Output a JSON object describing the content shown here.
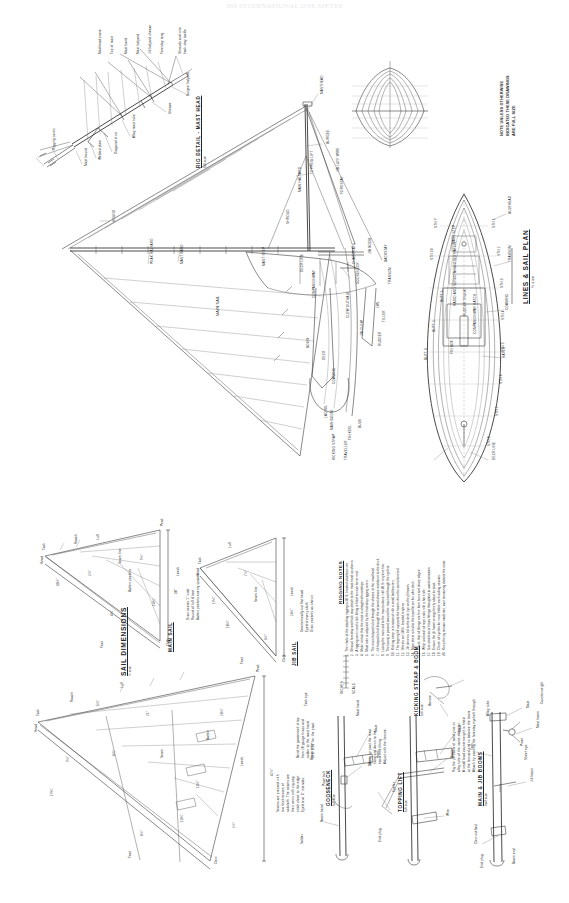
{
  "page": {
    "header": "369   INTERNATIONAL ONE METRE",
    "sheet_background": "#ffffff",
    "ink_color": "#262626"
  },
  "titles": {
    "lines_sail_plan": "LINES & SAIL PLAN",
    "lines_sail_plan_scale": "½ size",
    "sail_dimensions": "SAIL DIMENSIONS",
    "sail_dimensions_scale": "½ size",
    "rig_detail_head": "RIG DETAIL - MAST HEAD",
    "rig_detail_head_scale": "full size",
    "rigging_notes": "RIGGING NOTES",
    "gooseneck": "GOOSENECK",
    "gooseneck_scale": "full size",
    "kicking_strap": "KICKING STRAP & BOOM",
    "kicking_strap_scale": "full size",
    "topping_lift": "TOPPING LIFT",
    "topping_lift_scale": "full size",
    "main_boom": "MAIN & JIB BOOMS",
    "main_boom_scale": "half size",
    "sail_dims_main": "MAIN SAIL",
    "sail_dims_jib": "JIB SAIL"
  },
  "general_note": {
    "line1": "NOTE  UNLESS OTHERWISE",
    "line2": "INDICATED THESE DRAWINGS",
    "line3": "ARE FULL SIZE"
  },
  "masthead_detail": {
    "labels": [
      "Shrouds and wire",
      "back stay tackle",
      "Forestay tang",
      "Jib halyard sheave",
      "Main halyard",
      "Mast band",
      "Top of mast",
      "Masthead crane",
      "Burgee halyard",
      "Sheave",
      "Alloy mast tube",
      "Diagonal strut",
      "Welded plate",
      "Mast hound",
      "Rigging screw"
    ]
  },
  "sail_plan": {
    "labels": [
      "MASTHEAD",
      "BURGEE",
      "TOPPING LIFT",
      "MAIN HALYARD",
      "MAST BAND",
      "PEAK HALYARD",
      "HOUND",
      "BACKSTAY",
      "JIB LUFF WIRE",
      "JIB BOOM",
      "JIB CLEW",
      "MAIN SAIL",
      "LACING",
      "MAIN BOOM",
      "BOOM",
      "KICKING STRAP",
      "CLEW OUTHAUL",
      "TRAVELLER",
      "GOOSENECK",
      "COMPANIONWAY",
      "DECK",
      "COAMING",
      "TRANSOM",
      "FIN KEEL",
      "BULB",
      "LWL",
      "RUDDER",
      "TILLER",
      "MAST STEP",
      "FORESTAY",
      "SHROUD",
      "DECK LINE",
      "CHAINPLATE"
    ]
  },
  "hull_plan": {
    "labels": [
      "BULKHEAD",
      "TRANSOM",
      "COAMING",
      "HATCH",
      "COMPANIONWAY HATCH",
      "RUDDER TRUNK",
      "RADIO AND SERVO MOUNTING HATCH",
      "DECK LINE",
      "MAST STEP",
      "FIN BOX",
      "BUTT 1",
      "BUTT 2",
      "BUTT 3",
      "STN 1",
      "STN 2",
      "STN 3",
      "STN 4",
      "STN 5",
      "STN 6",
      "STN 7",
      "STN 8",
      "STN 9",
      "STN 10"
    ]
  },
  "sail_dimensions": {
    "main": {
      "title": "MAIN SAIL",
      "labels": [
        "Head",
        "Luff",
        "Leech",
        "Foot",
        "Tack",
        "Clew",
        "Batten pockets",
        "Peak",
        "Roach",
        "Seam line"
      ],
      "notes": [
        "Draw seams 1\" wide",
        "Round of luff & foot",
        "Batten pockets evenly spaced"
      ],
      "measurements": [
        "30\"",
        "38½\"",
        "9½\"",
        "4¾\"",
        "2¼\"",
        "14¾\""
      ]
    },
    "jib": {
      "title": "JIB SAIL",
      "labels": [
        "Head",
        "Luff",
        "Leech",
        "Foot",
        "Tack",
        "Clew",
        "Seam line"
      ],
      "notes": [
        "Geometrically cut flat head",
        "Eyelets every cloth",
        "Draw pockets as shown"
      ],
      "measurements": [
        "24½\"",
        "19½\"",
        "7½\"",
        "3½\"",
        "10¼\""
      ]
    },
    "lower": {
      "labels": [
        "Head",
        "Luff",
        "Leech",
        "Foot",
        "Tack",
        "Clew",
        "Peak",
        "Roach",
        "Batten",
        "Seam"
      ],
      "notes": [
        "Seams are pressed with",
        "two thicknesses of",
        "sailcloth. The seams are",
        "then sewn with zig-zag",
        "stitch close to the edge.",
        "Eyelets at 6\" intervals."
      ],
      "measurements": [
        "47½\"",
        "19¾\"",
        "28¼\"",
        "8½\"",
        "5¼\"",
        "13¾\"",
        "4¼\"",
        "21\"",
        "16½\"",
        "9¼\"",
        "2½\""
      ]
    }
  },
  "rigging_notes": {
    "heading": "RIGGING NOTES",
    "items": [
      "The whole of the standing rigging is 20 lb. braided stainless wire.",
      "Shroud, forestay and back stay attach to the mast band as shown.",
      "A rigging screw and a link fitting is fitted to each lower end.",
      "Make certain that the mast is straight athwartships.",
      "Mast rake is adjusted by the backstay rigging screw.",
      "The main halyard is led through the sheave at the masthead.",
      "Jib halyard is led through the second sheave and down to the deck.",
      "Lacing the main sail to the mast is done with 20 lb. terylene line.",
      "The lacing is passed around the mast and through the eyelets.",
      "Kicking strap is tensioned with a small bottlescrew.",
      "The topping lift supports the boom when the sail is lowered.",
      "Sheets are 20 lb. braided terylene.",
      "Jib sheet is led to the deck eye on the jib boom.",
      "Main sheet is led to the traveller on the after deck.",
      "Check that all fittings are free from burrs and sharp edges.",
      "Whip and seal all rope ends with a hot knife.",
      "Use stainless or brass fittings throughout to avoid corrosion.",
      "Ensure the jib boom swings freely about its pivot.",
      "Check all eyelets for wear before each sailing session.",
      "Keep the rig tension moderate, over tensioning distorts the mast."
    ]
  },
  "detail_gooseneck": {
    "title": "GOOSENECK",
    "scale": "full size",
    "labels": [
      "Mast",
      "Boom",
      "Pivot bolt",
      "Boom band",
      "Mast band",
      "Brass strip",
      "Solder",
      "Tack eye"
    ],
    "notes": [
      "Bend the gooseneck strap",
      "from 20 gauge brass and",
      "solder to the mast band.",
      "Drill 1/16\" for the pivot."
    ]
  },
  "detail_topping": {
    "title": "TOPPING LIFT",
    "scale": "full size",
    "labels": [
      "Mast",
      "Boom",
      "Wire",
      "Eyelet",
      "Bowsie",
      "Hook",
      "End plug"
    ],
    "notes": [
      "Bring up past the mast",
      "band and down to the",
      "boom end fitting.",
      "Adjust with the bowsie."
    ]
  },
  "detail_booms": {
    "title": "MAIN & JIB BOOMS",
    "scale": "half size",
    "labels": [
      "Mast",
      "Main boom",
      "Jib boom",
      "Clew outhaul",
      "Tack",
      "Pivot",
      "Boom end",
      "Sheet eye",
      "Alloy tube",
      "End plug",
      "Counterweight"
    ],
    "notes": [
      "Rig the jib boom of solid pine or",
      "alloy tube of the same diameter.",
      "A small lead counterweight is fitted",
      "at the forward end to balance the boom.",
      "Attach by passing the forestay eyebolt through."
    ]
  },
  "scale_bar": {
    "label": "SCALE",
    "values": [
      "0",
      "1",
      "2",
      "3",
      "4",
      "5",
      "6"
    ],
    "unit": "INCHES"
  }
}
